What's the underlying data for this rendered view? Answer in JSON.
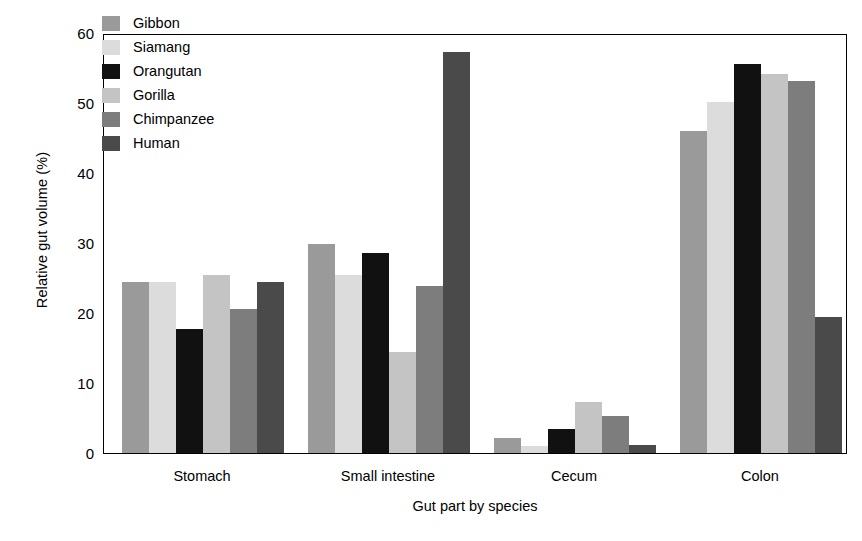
{
  "chart_data": {
    "type": "bar",
    "title": "",
    "xlabel": "Gut part by species",
    "ylabel": "Relative gut volume (%)",
    "categories": [
      "Stomach",
      "Small intestine",
      "Cecum",
      "Colon"
    ],
    "ylim": [
      0,
      60
    ],
    "yticks": [
      60,
      50,
      40,
      30,
      20,
      10,
      0
    ],
    "grid": false,
    "legend_position": "top-left",
    "series": [
      {
        "name": "Gibbon",
        "color": "#9a9a9a",
        "values": [
          24.5,
          29.8,
          2.2,
          46.0
        ]
      },
      {
        "name": "Siamang",
        "color": "#dcdcdc",
        "values": [
          24.5,
          25.4,
          1.0,
          50.1
        ]
      },
      {
        "name": "Orangutan",
        "color": "#111111",
        "values": [
          17.7,
          28.6,
          3.4,
          55.6
        ]
      },
      {
        "name": "Gorilla",
        "color": "#c4c4c4",
        "values": [
          25.5,
          14.4,
          7.3,
          54.2
        ]
      },
      {
        "name": "Chimpanzee",
        "color": "#7d7d7d",
        "values": [
          20.6,
          23.8,
          5.3,
          53.2
        ]
      },
      {
        "name": "Human",
        "color": "#4a4a4a",
        "values": [
          24.5,
          57.3,
          1.2,
          19.4
        ]
      }
    ]
  },
  "legend": {
    "items": [
      {
        "label": "Gibbon"
      },
      {
        "label": "Siamang"
      },
      {
        "label": "Orangutan"
      },
      {
        "label": "Gorilla"
      },
      {
        "label": "Chimpanzee"
      },
      {
        "label": "Human"
      }
    ]
  },
  "axes": {
    "y_tick_labels": [
      "60",
      "50",
      "40",
      "30",
      "20",
      "10",
      "0"
    ],
    "x_tick_labels": [
      "Stomach",
      "Small intestine",
      "Cecum",
      "Colon"
    ],
    "y_axis_title": "Relative gut volume (%)",
    "x_axis_title": "Gut part by species"
  }
}
